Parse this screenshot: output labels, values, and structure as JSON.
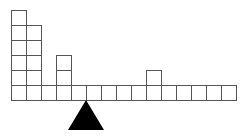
{
  "diagram": {
    "grid": {
      "origin_x": 11,
      "base_row_y": 85,
      "cell_size": 15,
      "base_cells": 15
    },
    "stacks": [
      {
        "column": 0,
        "extra_height": 5
      },
      {
        "column": 1,
        "extra_height": 4
      },
      {
        "column": 3,
        "extra_height": 2
      },
      {
        "column": 9,
        "extra_height": 1
      }
    ],
    "fulcrum": {
      "apex_x": 86,
      "apex_y": 100,
      "base_y": 130,
      "half_width": 18,
      "color": "#000000"
    },
    "line_color": "#555555"
  }
}
